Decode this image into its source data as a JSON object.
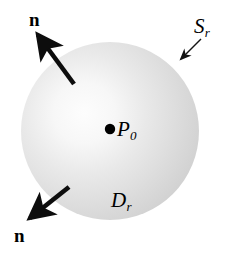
{
  "figure": {
    "background_color": "#ffffff",
    "ink_color": "#000000",
    "sphere": {
      "fill_light": "#fbfbfb",
      "fill_mid": "#dcdcdc",
      "fill_edge": "#c9c9c9",
      "center_x": 110,
      "center_y": 131,
      "radius": 89,
      "highlight_x": 85,
      "highlight_y": 103
    },
    "labels": {
      "normal_top": "n",
      "normal_bottom": "n",
      "surface_symbol": "S",
      "surface_subscript": "r",
      "ball_symbol": "D",
      "ball_subscript": "r",
      "center_symbol": "P",
      "center_subscript": "0"
    },
    "arrows": {
      "normal_top": {
        "tail_x": 74,
        "tail_y": 84,
        "tip_x": 36,
        "tip_y": 33,
        "weight": "thick"
      },
      "normal_bottom": {
        "tail_x": 69,
        "tail_y": 187,
        "tip_x": 28,
        "tip_y": 220,
        "weight": "thick"
      },
      "surface_pointer": {
        "tail_x": 201,
        "tail_y": 39,
        "tip_x": 179,
        "tip_y": 61,
        "weight": "thin"
      }
    },
    "center_dot": {
      "x": 110,
      "y": 129,
      "radius": 5.2
    }
  }
}
